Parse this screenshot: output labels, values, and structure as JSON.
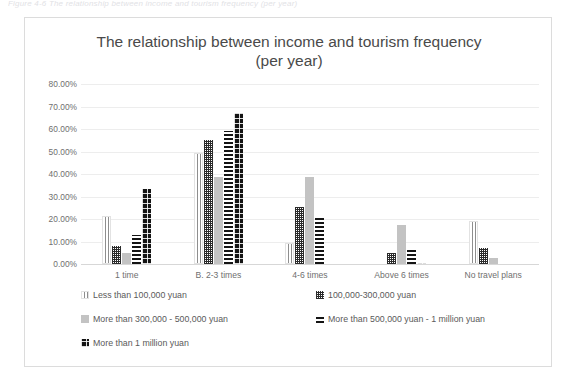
{
  "caption": {
    "text": "Figure 4-6 The relationship between income and tourism frequency (per year)"
  },
  "chart_data": {
    "type": "bar",
    "title": "The relationship between income and tourism frequency (per year)",
    "title_line1": "The relationship between income and tourism frequency",
    "title_line2": "(per year)",
    "xlabel": "",
    "ylabel": "",
    "ylim": [
      0,
      80
    ],
    "grid": true,
    "legend_position": "bottom",
    "y_ticks": [
      "0.00%",
      "10.00%",
      "20.00%",
      "30.00%",
      "40.00%",
      "50.00%",
      "60.00%",
      "70.00%",
      "80.00%"
    ],
    "y_tick_values": [
      0,
      10,
      20,
      30,
      40,
      50,
      60,
      70,
      80
    ],
    "categories": [
      "1 time",
      "B. 2-3 times",
      "4-6 times",
      "Above 6 times",
      "No travel plans"
    ],
    "series": [
      {
        "name": "Less than 100,000 yuan",
        "pattern": "vertical-stripe",
        "color": "#8e8e8e",
        "values": [
          21.5,
          49.5,
          9.5,
          0.0,
          19.0
        ]
      },
      {
        "name": "100,000-300,000 yuan",
        "pattern": "checkered",
        "color": "#2b2b2b",
        "values": [
          8.0,
          55.0,
          25.5,
          5.0,
          7.0
        ]
      },
      {
        "name": "More than 300,000 - 500,000 yuan",
        "pattern": "solid-gray",
        "color": "#c3c3c3",
        "values": [
          5.0,
          38.5,
          38.5,
          17.5,
          2.5
        ]
      },
      {
        "name": "More than 500,000 yuan - 1 million yuan",
        "pattern": "horizontal-stripe",
        "color": "#141414",
        "values": [
          13.0,
          59.0,
          21.0,
          7.0,
          0.0
        ]
      },
      {
        "name": "More than 1 million yuan",
        "pattern": "black-dotted",
        "color": "#141414",
        "values": [
          33.5,
          67.0,
          0.0,
          0.5,
          0.0
        ]
      }
    ]
  }
}
